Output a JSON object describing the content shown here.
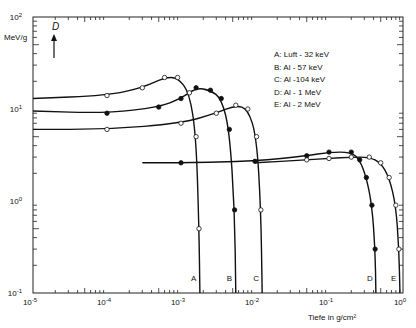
{
  "chart_data": {
    "type": "line",
    "title": "",
    "ylabel": "MeV/g",
    "ylabel_symbol": "D",
    "xlabel": "Tiefe in g/cm²",
    "xscale": "log",
    "yscale": "log",
    "xlim": [
      1e-05,
      1
    ],
    "ylim": [
      0.1,
      100
    ],
    "x_ticks": [
      "10-5",
      "10-4",
      "10-3",
      "10-2",
      "10-1",
      "100"
    ],
    "y_ticks": [
      "10-1",
      "100",
      "101",
      "102"
    ],
    "grid": false,
    "legend_position": "upper right (inside)",
    "legend": [
      {
        "key": "A",
        "text": "A:  Luft - 32 keV"
      },
      {
        "key": "B",
        "text": "B:  Al  - 57 keV"
      },
      {
        "key": "C",
        "text": "C:  Al  -104 keV"
      },
      {
        "key": "D",
        "text": "D:  Al  -   1 MeV"
      },
      {
        "key": "E",
        "text": "E:  Al  -   2 MeV"
      }
    ],
    "series": [
      {
        "name": "A",
        "label": "Luft - 32 keV",
        "marker": "open-circle",
        "x": [
          1e-05,
          0.0001,
          0.0003,
          0.0006,
          0.0009,
          0.0013,
          0.0016,
          0.00175,
          0.0018
        ],
        "y": [
          13,
          14,
          17,
          22,
          22,
          15,
          5,
          0.5,
          0.1
        ]
      },
      {
        "name": "B",
        "label": "Al - 57 keV",
        "marker": "filled-circle",
        "x": [
          1e-05,
          0.0001,
          0.0005,
          0.001,
          0.0016,
          0.0025,
          0.0035,
          0.0045,
          0.0053,
          0.0055
        ],
        "y": [
          9.5,
          9,
          10.5,
          13,
          17,
          16,
          13,
          6,
          0.8,
          0.1
        ]
      },
      {
        "name": "C",
        "label": "Al - 104 keV",
        "marker": "open-circle",
        "x": [
          1e-05,
          0.0001,
          0.001,
          0.003,
          0.0055,
          0.008,
          0.0105,
          0.012,
          0.0125
        ],
        "y": [
          6,
          6,
          7,
          9,
          11,
          10,
          5,
          0.8,
          0.1
        ]
      },
      {
        "name": "D",
        "label": "Al - 1 MeV",
        "marker": "filled-circle",
        "x": [
          0.0003,
          0.001,
          0.01,
          0.05,
          0.1,
          0.2,
          0.26,
          0.32,
          0.38,
          0.42,
          0.43
        ],
        "y": [
          2.6,
          2.6,
          2.7,
          3.1,
          3.4,
          3.4,
          2.8,
          1.8,
          0.9,
          0.3,
          0.1
        ]
      },
      {
        "name": "E",
        "label": "Al - 2 MeV",
        "marker": "open-circle",
        "x": [
          0.01,
          0.05,
          0.1,
          0.2,
          0.35,
          0.5,
          0.65,
          0.8,
          0.88,
          0.91
        ],
        "y": [
          2.6,
          2.8,
          2.9,
          3.0,
          3.0,
          2.6,
          1.8,
          0.9,
          0.3,
          0.1
        ]
      }
    ],
    "annotations": [
      "A",
      "B",
      "C",
      "D",
      "E"
    ]
  }
}
